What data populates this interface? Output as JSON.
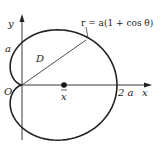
{
  "figure": {
    "curve_equation": "r = a(1 + cos θ)",
    "region_label": "D",
    "axes": {
      "x_label": "x",
      "y_label": "y",
      "origin_label": "O"
    },
    "ticks": {
      "y_tick_label": "a",
      "x_tick_label": "2 a"
    },
    "centroid": {
      "label": "x̄"
    },
    "colors": {
      "stroke": "#222222",
      "background": "#ffffff"
    }
  }
}
